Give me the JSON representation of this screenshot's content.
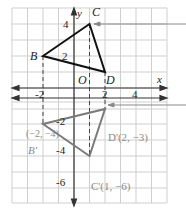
{
  "diagram": {
    "colors": {
      "grid": "#cfcfcf",
      "axis": "#333333",
      "original": "#111111",
      "image": "#7a7a7a",
      "pointer": "#8a8a8a"
    },
    "axes": {
      "x_label": "x",
      "y_label": "y",
      "origin_label": "O",
      "x_ticks": [
        "-2",
        "2",
        "4"
      ],
      "y_ticks": [
        "4",
        "2",
        "-2",
        "-4",
        "-6"
      ]
    },
    "original_triangle": {
      "B": {
        "label": "B",
        "coord": [
          -2,
          1.5
        ]
      },
      "C": {
        "label": "C",
        "coord": [
          1,
          3.5
        ]
      },
      "D": {
        "label": "D",
        "coord": [
          2,
          0.5
        ]
      }
    },
    "image_triangle": {
      "B_prime": {
        "label": "B'",
        "coord_label": "(−2, −4)",
        "coord": [
          -2,
          -4
        ]
      },
      "C_prime": {
        "label": "C'(1, −6)",
        "coord": [
          1,
          -6
        ]
      },
      "D_prime": {
        "label": "D'(2, −3)",
        "coord": [
          2,
          -3
        ]
      }
    }
  }
}
